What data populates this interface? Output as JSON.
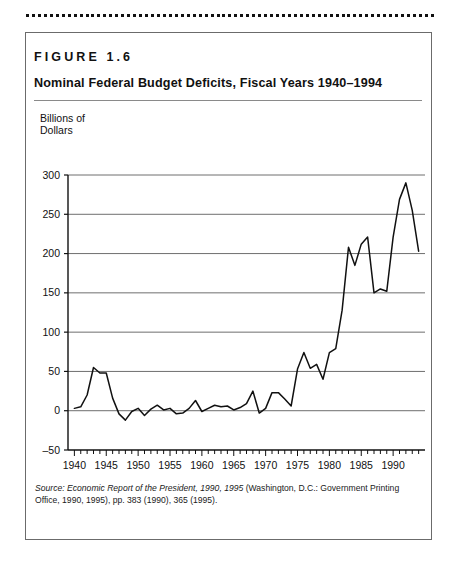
{
  "figure": {
    "label": "FIGURE  1.6",
    "title": "Nominal Federal Budget Deficits, Fiscal Years 1940–1994",
    "axis_title_line1": "Billions of",
    "axis_title_line2": "Dollars",
    "source_prefix": "Source: ",
    "source_italic_1": "Economic Report of the President, 1990, 1995",
    "source_rest_1": " (Washington, D.C.: Government Printing Office,",
    "source_rest_2": "1990, 1995), pp. 383 (1990), 365 (1995)."
  },
  "colors": {
    "line": "#111111",
    "grid": "#6e6e6e",
    "axis": "#111111",
    "text": "#111111",
    "box": "#6b6b6b"
  },
  "chart_data": {
    "type": "line",
    "title": "Nominal Federal Budget Deficits, Fiscal Years 1940–1994",
    "xlabel": "",
    "ylabel": "Billions of Dollars",
    "xlim": [
      1939,
      1995
    ],
    "ylim": [
      -50,
      300
    ],
    "yticks": [
      -50,
      0,
      50,
      100,
      150,
      200,
      250,
      300
    ],
    "ytick_labels": [
      "–50",
      "0",
      "50",
      "100",
      "150",
      "200",
      "250",
      "300"
    ],
    "xticks": [
      1940,
      1945,
      1950,
      1955,
      1960,
      1965,
      1970,
      1975,
      1980,
      1985,
      1990
    ],
    "xtick_labels": [
      "1940",
      "1945",
      "1950",
      "1955",
      "1960",
      "1965",
      "1970",
      "1975",
      "1980",
      "1985",
      "1990"
    ],
    "minor_xtick_interval": 1,
    "grid": "horizontal",
    "legend": "none",
    "x": [
      1940,
      1941,
      1942,
      1943,
      1944,
      1945,
      1946,
      1947,
      1948,
      1949,
      1950,
      1951,
      1952,
      1953,
      1954,
      1955,
      1956,
      1957,
      1958,
      1959,
      1960,
      1961,
      1962,
      1963,
      1964,
      1965,
      1966,
      1967,
      1968,
      1969,
      1970,
      1971,
      1972,
      1973,
      1974,
      1975,
      1976,
      1977,
      1978,
      1979,
      1980,
      1981,
      1982,
      1983,
      1984,
      1985,
      1986,
      1987,
      1988,
      1989,
      1990,
      1991,
      1992,
      1993,
      1994
    ],
    "values": [
      3,
      5,
      20,
      55,
      48,
      48,
      16,
      -4,
      -12,
      -1,
      3,
      -6,
      2,
      7,
      1,
      3,
      -4,
      -3,
      3,
      13,
      -1,
      3,
      7,
      5,
      6,
      1,
      4,
      9,
      25,
      -3,
      3,
      23,
      23,
      15,
      6,
      53,
      74,
      54,
      59,
      40,
      74,
      79,
      128,
      208,
      185,
      212,
      221,
      150,
      155,
      152,
      221,
      269,
      290,
      255,
      203
    ],
    "annotations": []
  }
}
